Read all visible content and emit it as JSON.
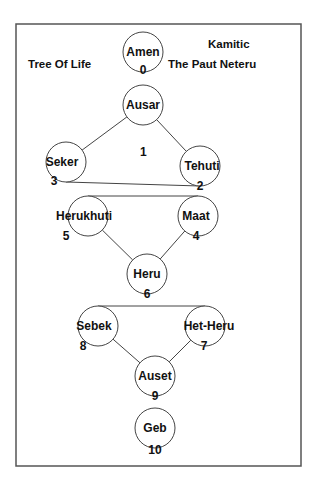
{
  "diagram": {
    "title_left": "Tree Of Life",
    "title_right_line1": "Kamitic",
    "title_right_line2": "The Paut Neteru",
    "center_number": "1",
    "nodes": [
      {
        "id": "amen",
        "label": "Amen",
        "number": "0"
      },
      {
        "id": "ausar",
        "label": "Ausar",
        "number": ""
      },
      {
        "id": "tehuti",
        "label": "Tehuti",
        "number": "2"
      },
      {
        "id": "seker",
        "label": "Seker",
        "number": "3"
      },
      {
        "id": "maat",
        "label": "Maat",
        "number": "4"
      },
      {
        "id": "herukhuti",
        "label": "Herukhuti",
        "number": "5"
      },
      {
        "id": "heru",
        "label": "Heru",
        "number": "6"
      },
      {
        "id": "het-heru",
        "label": "Het-Heru",
        "number": "7"
      },
      {
        "id": "sebek",
        "label": "Sebek",
        "number": "8"
      },
      {
        "id": "auset",
        "label": "Auset",
        "number": "9"
      },
      {
        "id": "geb",
        "label": "Geb",
        "number": "10"
      }
    ],
    "edges": [
      [
        "ausar",
        "seker"
      ],
      [
        "ausar",
        "tehuti"
      ],
      [
        "seker",
        "tehuti"
      ],
      [
        "herukhuti",
        "maat"
      ],
      [
        "herukhuti",
        "heru"
      ],
      [
        "maat",
        "heru"
      ],
      [
        "sebek",
        "het-heru"
      ],
      [
        "sebek",
        "auset"
      ],
      [
        "het-heru",
        "auset"
      ]
    ]
  }
}
